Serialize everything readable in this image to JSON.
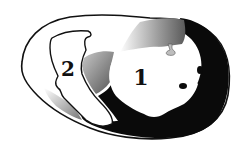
{
  "diagram": {
    "type": "anatomical cross-section",
    "background": "#ffffff",
    "colors": {
      "outline": "#111111",
      "dark_wall": "#0a0a0a",
      "shaded_wall": "#8a8a8a",
      "cavity": "#ffffff"
    },
    "labels": [
      {
        "id": "cavity-1",
        "text": "1"
      },
      {
        "id": "cavity-2",
        "text": "2"
      }
    ]
  }
}
